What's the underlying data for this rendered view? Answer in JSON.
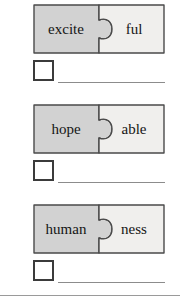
{
  "worksheet": {
    "rows": [
      {
        "root": "excite",
        "suffix": "ful",
        "checkbox_checked": false,
        "answer_value": ""
      },
      {
        "root": "hope",
        "suffix": "able",
        "checkbox_checked": false,
        "answer_value": ""
      },
      {
        "root": "human",
        "suffix": "ness",
        "checkbox_checked": false,
        "answer_value": ""
      }
    ],
    "colors": {
      "left_piece_fill": "#d2d2d2",
      "right_piece_fill": "#f0efed",
      "piece_outline": "#4a4a4a",
      "checkbox_outline": "#3b3b3b",
      "answer_line": "#8c8c8c",
      "bottom_rule": "#9a9a9a",
      "text": "#151515"
    }
  }
}
